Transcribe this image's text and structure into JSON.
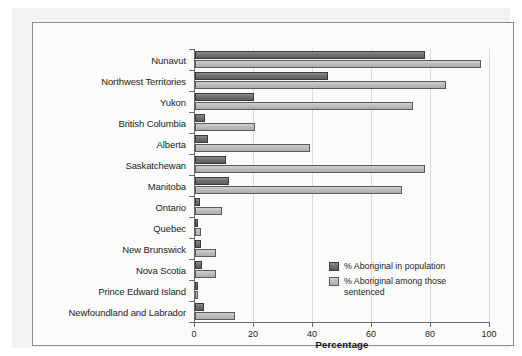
{
  "chart_data": {
    "type": "bar",
    "orientation": "horizontal",
    "title": "",
    "xlabel": "Percentage",
    "ylabel": "",
    "xlim": [
      0,
      100
    ],
    "xticks": [
      0,
      20,
      40,
      60,
      80,
      100
    ],
    "xtick_labels": [
      "0",
      "20",
      "40",
      "60",
      "80",
      "100"
    ],
    "grid": "vertical",
    "legend_position": "inside-right",
    "categories": [
      "Nunavut",
      "Northwest Territories",
      "Yukon",
      "British Columbia",
      "Alberta",
      "Saskatchewan",
      "Manitoba",
      "Ontario",
      "Quebec",
      "New Brunswick",
      "Nova Scotia",
      "Prince Edward Island",
      "Newfoundland and Labrador"
    ],
    "series": [
      {
        "name": "% Aboriginal in population",
        "color": "#6f6f6f",
        "values": [
          78,
          45,
          20,
          3.3,
          4.4,
          10.6,
          11.6,
          1.7,
          1,
          2,
          2.3,
          1,
          3
        ]
      },
      {
        "name": "% Aboriginal among those sentenced",
        "color": "#bdbdbd",
        "values": [
          97,
          85,
          74,
          20.4,
          39,
          78,
          70,
          9,
          2,
          7,
          7,
          1,
          13.5
        ]
      }
    ]
  },
  "legend": {
    "entries": [
      {
        "label": "% Aboriginal in population"
      },
      {
        "label": "% Aboriginal among those sentenced"
      }
    ]
  },
  "colors": {
    "series_dark": "#6f6f6f",
    "series_light": "#bdbdbd",
    "axis": "#6a6a6a",
    "grid": "#dcdcdc",
    "panel_bg": "#fbfbfa",
    "outer_bg": "#f2f2f0"
  }
}
